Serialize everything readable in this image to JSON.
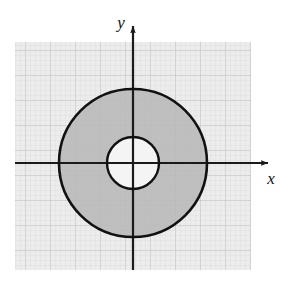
{
  "figure": {
    "name": "annulus-shaded-region",
    "title": "",
    "axes": {
      "x_label": "x",
      "y_label": "y",
      "x_axis_name": "x-axis",
      "y_axis_name": "y-axis",
      "arrow_x_name": "x-axis-arrow",
      "arrow_y_name": "y-axis-arrow",
      "axis_color": "#1a1a1a"
    },
    "grid": {
      "visible": true,
      "minor_spacing_px": 5,
      "major_spacing_px": 25,
      "minor_color": "#d8d8d8",
      "major_color": "#bdbdbd",
      "background_color": "#ececec"
    },
    "plot_area": {
      "left_px": 15,
      "top_px": 42,
      "width_px": 236,
      "height_px": 228
    },
    "origin": {
      "x_px": 133,
      "y_px": 163
    },
    "shapes": [
      {
        "name": "outer-circle",
        "type": "circle",
        "center_x_px": 133,
        "center_y_px": 163,
        "radius_px": 74,
        "stroke": "#111111",
        "stroke_width_px": 2.6,
        "fill": "#b8b8b8"
      },
      {
        "name": "inner-circle",
        "type": "circle",
        "center_x_px": 133,
        "center_y_px": 163,
        "radius_px": 26,
        "stroke": "#111111",
        "stroke_width_px": 2.4,
        "fill": "#f4f4f4"
      }
    ],
    "shaded_region": {
      "name": "annulus-region",
      "description": "annulus between inner and outer circle",
      "fill_color": "#b8b8b8"
    }
  }
}
